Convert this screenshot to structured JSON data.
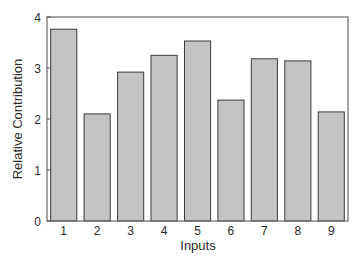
{
  "chart_data": {
    "type": "bar",
    "title": "",
    "xlabel": "Inputs",
    "ylabel": "Relative Contribution",
    "categories": [
      "1",
      "2",
      "3",
      "4",
      "5",
      "6",
      "7",
      "8",
      "9"
    ],
    "values": [
      3.76,
      2.1,
      2.92,
      3.25,
      3.53,
      2.37,
      3.18,
      3.14,
      2.14
    ],
    "ylim": [
      0,
      4
    ],
    "yticks": [
      0,
      1,
      2,
      3,
      4
    ],
    "grid": false,
    "legend": null,
    "colors": {
      "bar_fill": "#c4c4c4",
      "bar_edge": "#3a3a3a",
      "axis": "#555555"
    }
  }
}
